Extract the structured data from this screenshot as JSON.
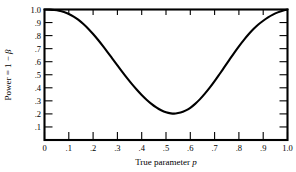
{
  "chart_data": {
    "type": "line",
    "title": "",
    "subtitle": "",
    "xlabel": "True parameter p",
    "xlabel_plain": "True parameter",
    "xlabel_italic": "p",
    "ylabel": "Power = 1 − β",
    "ylabel_parts": {
      "prefix": "Power = 1 − ",
      "symbol": "β"
    },
    "xlim": [
      0,
      1.0
    ],
    "ylim": [
      0,
      1.0
    ],
    "grid": false,
    "legend": null,
    "legend_position": "none",
    "x_tick_labels": [
      "0",
      ".1",
      ".2",
      ".3",
      ".4",
      ".5",
      ".6",
      ".7",
      ".8",
      ".9",
      "1.0"
    ],
    "x_tick_values": [
      0,
      0.1,
      0.2,
      0.3,
      0.4,
      0.5,
      0.6,
      0.7,
      0.8,
      0.9,
      1.0
    ],
    "y_tick_labels": [
      ".1",
      ".2",
      ".3",
      ".4",
      ".5",
      ".6",
      ".7",
      ".8",
      ".9",
      "1.0"
    ],
    "y_tick_values": [
      0.1,
      0.2,
      0.3,
      0.4,
      0.5,
      0.6,
      0.7,
      0.8,
      0.9,
      1.0
    ],
    "series": [
      {
        "name": "Power curve",
        "color": "#000000",
        "x": [
          0.0,
          0.02,
          0.04,
          0.06,
          0.08,
          0.1,
          0.12,
          0.14,
          0.16,
          0.18,
          0.2,
          0.22,
          0.24,
          0.26,
          0.28,
          0.3,
          0.32,
          0.34,
          0.36,
          0.38,
          0.4,
          0.42,
          0.44,
          0.46,
          0.48,
          0.5,
          0.52,
          0.54,
          0.56,
          0.58,
          0.6,
          0.62,
          0.64,
          0.66,
          0.68,
          0.7,
          0.72,
          0.74,
          0.76,
          0.78,
          0.8,
          0.82,
          0.84,
          0.86,
          0.88,
          0.9,
          0.92,
          0.94,
          0.96,
          0.98,
          1.0
        ],
        "y": [
          1.0,
          0.999,
          0.996,
          0.99,
          0.98,
          0.966,
          0.946,
          0.92,
          0.889,
          0.853,
          0.812,
          0.768,
          0.721,
          0.672,
          0.622,
          0.572,
          0.522,
          0.474,
          0.428,
          0.385,
          0.345,
          0.309,
          0.277,
          0.25,
          0.228,
          0.212,
          0.204,
          0.203,
          0.21,
          0.225,
          0.247,
          0.277,
          0.313,
          0.355,
          0.401,
          0.451,
          0.504,
          0.558,
          0.612,
          0.666,
          0.718,
          0.766,
          0.81,
          0.85,
          0.885,
          0.914,
          0.94,
          0.961,
          0.978,
          0.991,
          1.0
        ],
        "minimum": {
          "x": 0.53,
          "y": 0.14
        },
        "endpoints": [
          {
            "x": 0.0,
            "y": 1.0
          },
          {
            "x": 1.0,
            "y": 1.0
          }
        ]
      }
    ]
  },
  "figure": {
    "background_color": "#ffffff",
    "frame_color": "#000000",
    "curve_color": "#000000"
  }
}
